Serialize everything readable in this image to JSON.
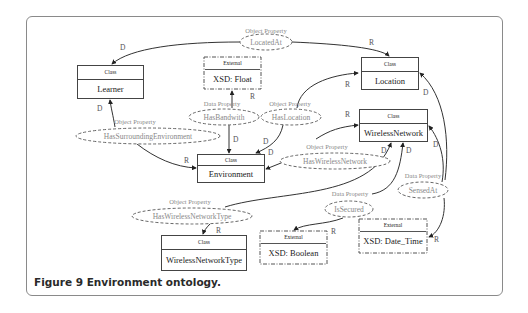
{
  "figure": {
    "caption_bold": "Figure 9",
    "caption_text": " Environment ontology."
  },
  "classes": [
    {
      "id": "learner",
      "header": "Class",
      "name": "Learner"
    },
    {
      "id": "location",
      "header": "Class",
      "name": "Location"
    },
    {
      "id": "wireless_network",
      "header": "Class",
      "name": "WirelessNetwork"
    },
    {
      "id": "environment",
      "header": "Class",
      "name": "Environment"
    },
    {
      "id": "wireless_network_type",
      "header": "Class",
      "name": "WirelessNetworkType"
    }
  ],
  "externals": [
    {
      "id": "xsd_float",
      "header": "External",
      "name": "XSD: Float"
    },
    {
      "id": "xsd_boolean",
      "header": "External",
      "name": "XSD: Boolean"
    },
    {
      "id": "xsd_date_time",
      "header": "External",
      "name": "XSD: Date_Time"
    }
  ],
  "properties": [
    {
      "id": "located_at",
      "kind": "Object Property",
      "name": "LocatedAt",
      "domain": "Learner",
      "range": "Location"
    },
    {
      "id": "has_bandwith",
      "kind": "Data Property",
      "name": "HasBandwith",
      "domain": "Environment",
      "range": "XSD: Float"
    },
    {
      "id": "has_location",
      "kind": "Object Property",
      "name": "HasLocation",
      "domain": "Environment",
      "range": "Location"
    },
    {
      "id": "has_surrounding_environment",
      "kind": "Object Property",
      "name": "HasSurroundingEnvironment",
      "domain": "Learner",
      "range": "Environment"
    },
    {
      "id": "has_wireless_network",
      "kind": "Object Property",
      "name": "HasWirelessNetwork",
      "domain": "Environment",
      "range": "WirelessNetwork"
    },
    {
      "id": "has_wireless_network_type",
      "kind": "Object Property",
      "name": "HasWirelessNetworkType",
      "domain": "WirelessNetwork",
      "range": "WirelessNetworkType"
    },
    {
      "id": "is_secured",
      "kind": "Data Property",
      "name": "IsSecured",
      "domain": "WirelessNetwork",
      "range": "XSD: Boolean"
    },
    {
      "id": "sensed_at",
      "kind": "Data Property",
      "name": "SensedAt",
      "domain": "WirelessNetwork",
      "range": "XSD: Date_Time"
    }
  ],
  "edge_labels": {
    "domain": "D",
    "range": "R"
  }
}
